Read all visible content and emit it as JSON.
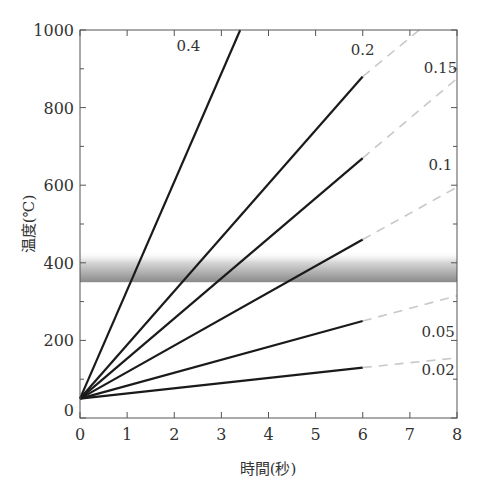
{
  "chart_data": {
    "type": "line",
    "title": "",
    "xlabel": "時間(秒)",
    "ylabel": "温度(℃)",
    "xlim": [
      0,
      8
    ],
    "ylim": [
      0,
      1000
    ],
    "xticks": [
      0,
      1,
      2,
      3,
      4,
      5,
      6,
      7,
      8
    ],
    "yticks": [
      0,
      200,
      400,
      600,
      800,
      1000
    ],
    "y0_label": "0",
    "grid": false,
    "band": {
      "y_low": 350,
      "y_high": 430,
      "description": "shaded gradient band"
    },
    "start_point": {
      "x": 0,
      "y": 50
    },
    "series": [
      {
        "name": "0.4",
        "solid": [
          [
            0,
            50
          ],
          [
            3.4,
            1000
          ]
        ],
        "dashed": [],
        "label_pos": [
          2.3,
          945
        ]
      },
      {
        "name": "0.2",
        "solid": [
          [
            0,
            50
          ],
          [
            6,
            880
          ]
        ],
        "dashed": [
          [
            6,
            880
          ],
          [
            7.2,
            1000
          ]
        ],
        "label_pos": [
          6.0,
          935
        ]
      },
      {
        "name": "0.15",
        "solid": [
          [
            0,
            50
          ],
          [
            6,
            670
          ]
        ],
        "dashed": [
          [
            6,
            670
          ],
          [
            8,
            875
          ]
        ],
        "label_pos": [
          7.65,
          890
        ]
      },
      {
        "name": "0.1",
        "solid": [
          [
            0,
            50
          ],
          [
            6,
            460
          ]
        ],
        "dashed": [
          [
            6,
            460
          ],
          [
            8,
            595
          ]
        ],
        "label_pos": [
          7.65,
          640
        ]
      },
      {
        "name": "0.05",
        "solid": [
          [
            0,
            50
          ],
          [
            6,
            250
          ]
        ],
        "dashed": [
          [
            6,
            250
          ],
          [
            8,
            315
          ]
        ],
        "label_pos": [
          7.6,
          210
        ]
      },
      {
        "name": "0.02",
        "solid": [
          [
            0,
            50
          ],
          [
            6,
            130
          ]
        ],
        "dashed": [
          [
            6,
            130
          ],
          [
            8,
            155
          ]
        ],
        "label_pos": [
          7.6,
          110
        ]
      }
    ]
  }
}
